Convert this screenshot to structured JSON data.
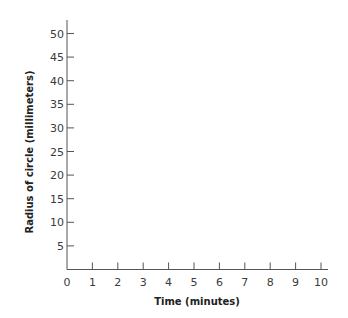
{
  "chart_data": {
    "type": "line",
    "title": "",
    "xlabel": "Time (minutes)",
    "ylabel": "Radius of circle (millimeters)",
    "x_ticks": [
      0,
      1,
      2,
      3,
      4,
      5,
      6,
      7,
      8,
      9,
      10
    ],
    "y_ticks": [
      5,
      10,
      15,
      20,
      25,
      30,
      35,
      40,
      45,
      50
    ],
    "xlim": [
      0,
      10
    ],
    "ylim": [
      0,
      52
    ],
    "grid": false,
    "legend": null,
    "series": []
  },
  "colors": {
    "axis": "#555555",
    "text": "#3a3a3a"
  }
}
